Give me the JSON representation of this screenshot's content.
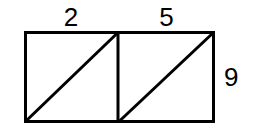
{
  "figure": {
    "background_color": "#ffffff",
    "stroke_color": "#000000",
    "stroke_width": 3,
    "labels": {
      "top_left": "2",
      "top_right": "5",
      "right_side": "9"
    },
    "geometry": {
      "outer_rect": {
        "x": 24,
        "y": 31,
        "width": 191,
        "height": 92
      },
      "divider_x": 118,
      "left_cell": {
        "x": 24,
        "y": 31,
        "width": 94,
        "height": 92
      },
      "right_cell": {
        "x": 118,
        "y": 31,
        "width": 97,
        "height": 92
      },
      "diagonals": [
        {
          "x1": 24,
          "y1": 123,
          "x2": 118,
          "y2": 31
        },
        {
          "x1": 118,
          "y1": 123,
          "x2": 215,
          "y2": 31
        }
      ]
    }
  }
}
